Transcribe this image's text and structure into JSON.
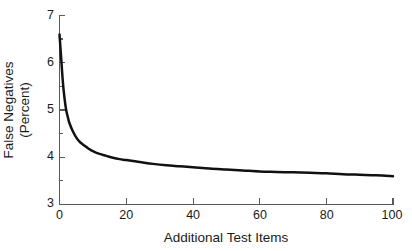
{
  "chart_data": {
    "type": "line",
    "title": "",
    "xlabel": "Additional Test Items",
    "ylabel_line1": "False Negatives",
    "ylabel_line2": "(Percent)",
    "ylabel": "False Negatives (Percent)",
    "xlim": [
      0,
      100
    ],
    "ylim": [
      3,
      7
    ],
    "xticks": [
      0,
      20,
      40,
      60,
      80,
      100
    ],
    "yticks": [
      3,
      4,
      5,
      6,
      7
    ],
    "xtick_labels": [
      "0",
      "20",
      "40",
      "60",
      "80",
      "100"
    ],
    "ytick_labels": [
      "3",
      "4",
      "5",
      "6",
      "7"
    ],
    "grid": false,
    "legend": null,
    "minor_yticks": [
      3.5,
      4.5,
      5.5,
      6.5
    ],
    "curve_color": "#111111",
    "axis_color": "#5a5a5a",
    "background_color": "#ffffff",
    "series": [
      {
        "name": "False Negatives",
        "x": [
          0,
          0.5,
          1,
          1.5,
          2,
          2.5,
          3,
          4,
          5,
          6,
          7,
          8,
          9,
          10,
          12,
          14,
          16,
          18,
          20,
          24,
          28,
          32,
          36,
          40,
          45,
          50,
          55,
          60,
          65,
          70,
          75,
          80,
          85,
          90,
          95,
          100
        ],
        "y": [
          6.6,
          6.1,
          5.6,
          5.25,
          5.0,
          4.85,
          4.72,
          4.55,
          4.42,
          4.33,
          4.27,
          4.22,
          4.17,
          4.13,
          4.07,
          4.03,
          3.99,
          3.96,
          3.94,
          3.9,
          3.86,
          3.83,
          3.81,
          3.79,
          3.76,
          3.74,
          3.72,
          3.7,
          3.69,
          3.68,
          3.67,
          3.66,
          3.64,
          3.63,
          3.62,
          3.6
        ]
      }
    ]
  }
}
